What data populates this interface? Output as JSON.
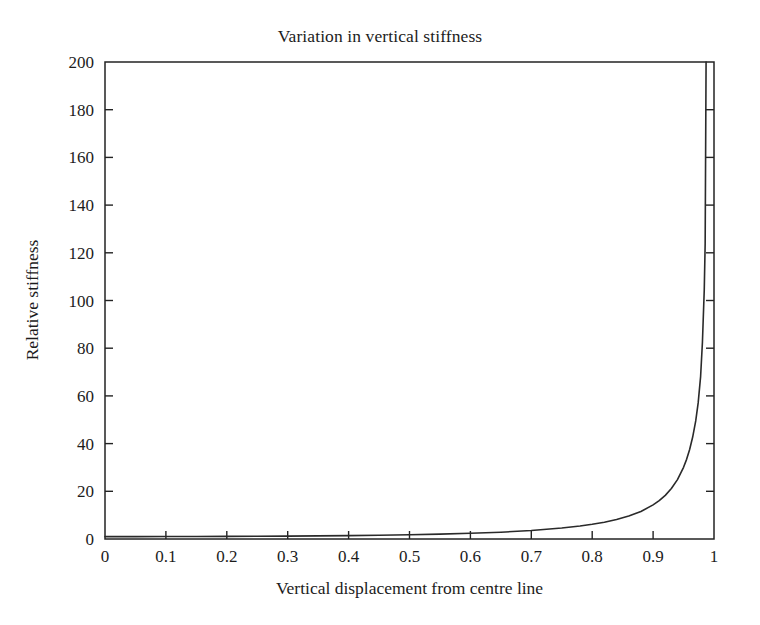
{
  "chart_data": {
    "type": "line",
    "title": "Variation in vertical stiffness",
    "xlabel": "Vertical displacement from centre line",
    "ylabel": "Relative stiffness",
    "xlim": [
      0,
      1
    ],
    "ylim": [
      0,
      200
    ],
    "grid": false,
    "legend": null,
    "xticks": [
      "0",
      "0.1",
      "0.2",
      "0.3",
      "0.4",
      "0.5",
      "0.6",
      "0.7",
      "0.8",
      "0.9",
      "1"
    ],
    "xtick_values": [
      0,
      0.1,
      0.2,
      0.3,
      0.4,
      0.5,
      0.6,
      0.7,
      0.8,
      0.9,
      1
    ],
    "yticks": [
      "0",
      "20",
      "40",
      "60",
      "80",
      "100",
      "120",
      "140",
      "160",
      "180",
      "200"
    ],
    "ytick_values": [
      0,
      20,
      40,
      60,
      80,
      100,
      120,
      140,
      160,
      180,
      200
    ],
    "series": [
      {
        "name": "Relative stiffness",
        "color": "#2a2a2a",
        "x": [
          0.0,
          0.05,
          0.1,
          0.15,
          0.2,
          0.25,
          0.3,
          0.35,
          0.4,
          0.45,
          0.5,
          0.55,
          0.6,
          0.65,
          0.7,
          0.75,
          0.78,
          0.8,
          0.82,
          0.84,
          0.86,
          0.88,
          0.9,
          0.91,
          0.92,
          0.93,
          0.94,
          0.95,
          0.955,
          0.96,
          0.965,
          0.97,
          0.974,
          0.978,
          0.981,
          0.984,
          0.9855,
          0.987
        ],
        "y": [
          1.0,
          1.01,
          1.03,
          1.06,
          1.1,
          1.15,
          1.22,
          1.31,
          1.43,
          1.59,
          1.78,
          2.04,
          2.38,
          2.86,
          3.55,
          4.62,
          5.47,
          6.17,
          7.05,
          8.17,
          9.62,
          11.55,
          14.3,
          16.08,
          18.3,
          21.15,
          24.9,
          30.05,
          33.4,
          37.55,
          42.75,
          49.5,
          57.05,
          68.1,
          82.5,
          104.5,
          124.0,
          200.0
        ]
      }
    ]
  },
  "axis": {
    "x_tick_label_fontsize": "17",
    "y_tick_label_fontsize": "17"
  }
}
